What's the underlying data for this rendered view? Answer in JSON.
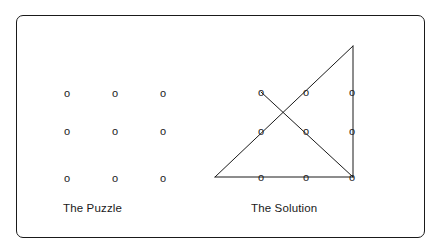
{
  "figure": {
    "background_color": "#ffffff",
    "border_color": "#1a1a1a",
    "stroke_color": "#1a1a1a",
    "dot_glyph": "o"
  },
  "panels": [
    {
      "id": "puzzle",
      "caption": "The Puzzle",
      "dots": [
        {
          "x": 67,
          "y": 93
        },
        {
          "x": 115,
          "y": 93
        },
        {
          "x": 163,
          "y": 93
        },
        {
          "x": 67,
          "y": 131
        },
        {
          "x": 115,
          "y": 131
        },
        {
          "x": 163,
          "y": 131
        },
        {
          "x": 67,
          "y": 178
        },
        {
          "x": 115,
          "y": 178
        },
        {
          "x": 163,
          "y": 178
        }
      ],
      "lines": []
    },
    {
      "id": "solution",
      "caption": "The Solution",
      "dots": [
        {
          "x": 261,
          "y": 92
        },
        {
          "x": 306,
          "y": 92
        },
        {
          "x": 352,
          "y": 92
        },
        {
          "x": 261,
          "y": 131
        },
        {
          "x": 306,
          "y": 131
        },
        {
          "x": 352,
          "y": 131
        },
        {
          "x": 261,
          "y": 177
        },
        {
          "x": 306,
          "y": 177
        },
        {
          "x": 352,
          "y": 177
        }
      ],
      "lines": [
        {
          "name": "bottom-edge",
          "x1": 215,
          "y1": 177,
          "x2": 353,
          "y2": 177
        },
        {
          "name": "right-vertical",
          "x1": 353,
          "y1": 46,
          "x2": 353,
          "y2": 177
        },
        {
          "name": "rising-diagonal",
          "x1": 215,
          "y1": 177,
          "x2": 353,
          "y2": 46
        },
        {
          "name": "falling-diagonal",
          "x1": 261,
          "y1": 92,
          "x2": 353,
          "y2": 177
        }
      ]
    }
  ]
}
